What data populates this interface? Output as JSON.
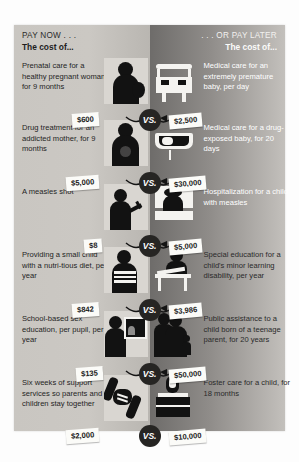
{
  "headers": {
    "left_kicker": "PAY NOW . . .",
    "left_subhead": "The cost of...",
    "right_kicker": ". . . OR PAY LATER",
    "right_subhead": "The cost of..."
  },
  "vs_label": "VS.",
  "rows": [
    {
      "left_caption": "Prenatal care for a healthy pregnant woman, for 9 months",
      "left_price": "$600",
      "left_art": "pregnant-woman-silhouette",
      "right_caption": "Medical care for an extremely premature baby, per day",
      "right_price": "$2,500",
      "right_art": "incubator-silhouette"
    },
    {
      "left_caption": "Drug treatment for an addicted mother, for 9 months",
      "left_price": "$5,000",
      "left_art": "addicted-mother-silhouette",
      "right_caption": "Medical care for a drug-exposed baby, for 20 days",
      "right_price": "$30,000",
      "right_art": "bassinet-silhouette"
    },
    {
      "left_caption": "A measles shot",
      "left_price": "$8",
      "left_art": "child-vaccination-silhouette",
      "right_caption": "Hospitalization for a child with measles",
      "right_price": "$5,000",
      "right_art": "hospital-bed-silhouette"
    },
    {
      "left_caption": "Providing a small child with a nutri-tious diet, per year",
      "left_price": "$842",
      "left_art": "child-with-food-silhouette",
      "right_caption": "Special education for a child's minor learning disability, per year",
      "right_price": "$3,986",
      "right_art": "child-at-desk-silhouette"
    },
    {
      "left_caption": "School-based sex education, per pupil, per year",
      "left_price": "$135",
      "left_art": "student-with-screen-silhouette",
      "right_caption": "Public assistance to a child born of a teenage parent, for 20 years",
      "right_price": "$50,000",
      "right_art": "teen-parent-family-silhouette"
    },
    {
      "left_caption": "Six weeks of support services so parents and children stay together",
      "left_price": "$2,000",
      "left_art": "holding-hands-silhouette",
      "right_caption": "Foster care for a child, for 18 months",
      "right_price": "$10,000",
      "right_art": "suitcase-silhouette"
    }
  ],
  "colors": {
    "left_panel": "#c9c6c1",
    "right_panel_dark": "#6e6c6a",
    "silhouette": "#121212",
    "tag_background": "#fbfbf8",
    "vs_badge": "#262523"
  }
}
